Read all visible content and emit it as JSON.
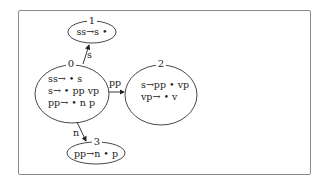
{
  "diagram": {
    "type": "LR parser state automaton",
    "nodes": [
      {
        "id": "0",
        "items": [
          "ss→ • s",
          "s→ • pp vp",
          "pp→ • n p"
        ]
      },
      {
        "id": "1",
        "items": [
          "ss→s •"
        ]
      },
      {
        "id": "2",
        "items": [
          "s→pp • vp",
          "vp→ • v"
        ]
      },
      {
        "id": "3",
        "items": [
          "pp→n • p"
        ]
      }
    ],
    "edges": [
      {
        "from": "0",
        "to": "1",
        "label": "s"
      },
      {
        "from": "0",
        "to": "2",
        "label": "pp"
      },
      {
        "from": "0",
        "to": "3",
        "label": "n"
      }
    ]
  }
}
